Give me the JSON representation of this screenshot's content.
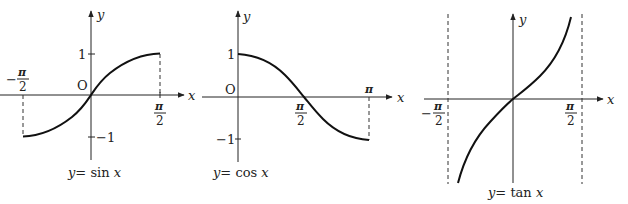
{
  "graphs": [
    {
      "id": "sin",
      "caption": "y = sin x",
      "caption_y": "y",
      "caption_eq": "= sin ",
      "caption_x": "x",
      "axis_x_label": "x",
      "axis_y_label": "y",
      "origin_label": "O",
      "y_ticks": {
        "top": "1",
        "bottom": "−1"
      },
      "x_ticks": {
        "left_num": "π",
        "left_den": "2",
        "left_sign": "−",
        "right_num": "π",
        "right_den": "2"
      },
      "domain": [
        "-π/2",
        "π/2"
      ],
      "range": [
        -1,
        1
      ]
    },
    {
      "id": "cos",
      "caption": "y = cos x",
      "caption_y": "y",
      "caption_eq": "= cos ",
      "caption_x": "x",
      "axis_x_label": "x",
      "axis_y_label": "y",
      "origin_label": "O",
      "y_ticks": {
        "top": "1",
        "bottom": "−1"
      },
      "x_ticks": {
        "mid_num": "π",
        "mid_den": "2",
        "end": "π"
      },
      "domain": [
        "0",
        "π"
      ],
      "range": [
        -1,
        1
      ]
    },
    {
      "id": "tan",
      "caption": "y = tan x",
      "caption_y": "y",
      "caption_eq": "= tan ",
      "caption_x": "x",
      "axis_x_label": "x",
      "axis_y_label": "y",
      "x_ticks": {
        "left_num": "π",
        "left_den": "2",
        "left_sign": "−",
        "right_num": "π",
        "right_den": "2"
      },
      "domain": [
        "-π/2",
        "π/2"
      ],
      "asymptotes": [
        "x = -π/2",
        "x = π/2"
      ]
    }
  ]
}
